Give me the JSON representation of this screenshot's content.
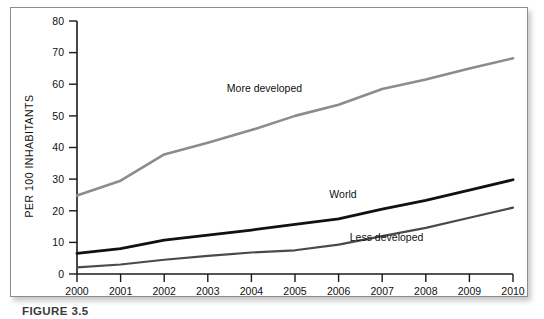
{
  "figure": {
    "caption": "FIGURE 3.5",
    "frame_color": "#8d8d8d",
    "background": "#ffffff"
  },
  "chart_data": {
    "type": "line",
    "title": "",
    "subtitle": "",
    "xlabel": "",
    "ylabel": "PER 100 INHABITANTS",
    "x": [
      2000,
      2001,
      2002,
      2003,
      2004,
      2005,
      2006,
      2007,
      2008,
      2009,
      2010
    ],
    "categories": [
      "2000",
      "2001",
      "2002",
      "2003",
      "2004",
      "2005",
      "2006",
      "2007",
      "2008",
      "2009",
      "2010"
    ],
    "xlim": [
      2000,
      2010
    ],
    "ylim": [
      0,
      80
    ],
    "yticks": [
      0,
      10,
      20,
      30,
      40,
      50,
      60,
      70,
      80
    ],
    "yticklabels": [
      "0",
      "10",
      "20",
      "30",
      "40",
      "50",
      "60",
      "70",
      "80"
    ],
    "xticklabels": [
      "2000",
      "2001",
      "2002",
      "2003",
      "2004",
      "2005",
      "2006",
      "2007",
      "2008",
      "2009",
      "2010"
    ],
    "grid": false,
    "legend": "inline-annotations",
    "series": [
      {
        "name": "More developed",
        "color": "#8c8c8c",
        "width": 2.6,
        "values": [
          24.8,
          29.5,
          37.8,
          41.5,
          45.5,
          50.0,
          53.5,
          58.5,
          61.5,
          65.0,
          68.2
        ],
        "label_x": 2004.3,
        "label_y": 57.5
      },
      {
        "name": "World",
        "color": "#111111",
        "width": 2.8,
        "values": [
          6.5,
          8.0,
          10.7,
          12.3,
          13.9,
          15.7,
          17.4,
          20.5,
          23.3,
          26.5,
          29.8
        ],
        "label_x": 2006.1,
        "label_y": 24.0
      },
      {
        "name": "Less developed",
        "color": "#4a4a4a",
        "width": 2.2,
        "values": [
          2.1,
          3.0,
          4.5,
          5.7,
          6.8,
          7.5,
          9.3,
          12.0,
          14.6,
          17.8,
          21.0
        ],
        "label_x": 2007.1,
        "label_y": 10.5
      }
    ],
    "annotations": [
      {
        "text": "More developed",
        "x": 2004.3,
        "y": 57.5
      },
      {
        "text": "World",
        "x": 2006.1,
        "y": 24.0
      },
      {
        "text": "Less developed",
        "x": 2007.1,
        "y": 10.5
      }
    ]
  }
}
